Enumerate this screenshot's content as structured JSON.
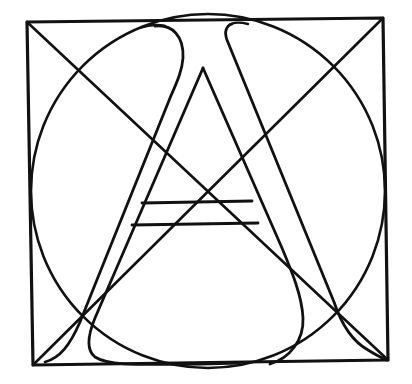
{
  "diagram": {
    "colors": {
      "ink": "#111111",
      "background": "#ffffff"
    },
    "elements": [
      {
        "name": "bounding-square",
        "type": "square",
        "corners": [
          [
            27,
            22
          ],
          [
            383,
            18
          ],
          [
            388,
            360
          ],
          [
            33,
            365
          ]
        ]
      },
      {
        "name": "diagonal-tl-br",
        "type": "line",
        "from": [
          27,
          22
        ],
        "to": [
          388,
          360
        ]
      },
      {
        "name": "diagonal-tr-bl",
        "type": "line",
        "from": [
          383,
          18
        ],
        "to": [
          33,
          365
        ]
      },
      {
        "name": "inscribed-circle",
        "type": "circle",
        "center": [
          208,
          191
        ],
        "radius": 177
      },
      {
        "name": "letter-a-outer-left-stroke",
        "type": "curve"
      },
      {
        "name": "letter-a-inner-counter",
        "type": "triangle",
        "apex": [
          203,
          68
        ]
      },
      {
        "name": "letter-a-right-stroke",
        "type": "curve"
      },
      {
        "name": "crossbar-top",
        "type": "line",
        "from": [
          142,
          203
        ],
        "to": [
          252,
          201
        ]
      },
      {
        "name": "crossbar-bottom",
        "type": "line",
        "from": [
          132,
          225
        ],
        "to": [
          258,
          223
        ]
      }
    ]
  }
}
